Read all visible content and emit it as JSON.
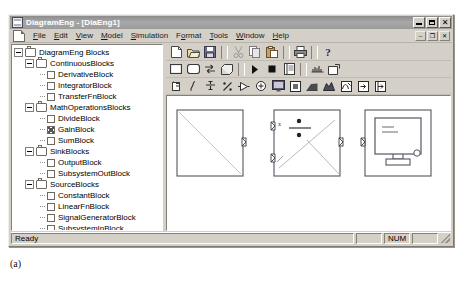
{
  "window": {
    "title": "DiagramEng - [DiaEng1]",
    "title_icon": "app-document-icon",
    "buttons": {
      "minimize": "–",
      "maximize": "□",
      "close": "✕"
    }
  },
  "menu": {
    "doc_icon": "mdi-document-icon",
    "items": [
      {
        "label": "File",
        "mnemonic": "F"
      },
      {
        "label": "Edit",
        "mnemonic": "E"
      },
      {
        "label": "View",
        "mnemonic": "V"
      },
      {
        "label": "Model",
        "mnemonic": "M"
      },
      {
        "label": "Simulation",
        "mnemonic": "S"
      },
      {
        "label": "Format",
        "mnemonic": "o"
      },
      {
        "label": "Tools",
        "mnemonic": "T"
      },
      {
        "label": "Window",
        "mnemonic": "W"
      },
      {
        "label": "Help",
        "mnemonic": "H"
      }
    ],
    "mdi_buttons": {
      "minimize": "–",
      "restore": "❐",
      "close": "✕"
    }
  },
  "tree": {
    "nodes": [
      {
        "label": "DiagramEng Blocks",
        "level": 0,
        "type": "folder",
        "state": "expanded"
      },
      {
        "label": "ContinuousBlocks",
        "level": 1,
        "type": "folder",
        "state": "expanded"
      },
      {
        "label": "DerivativeBlock",
        "level": 2,
        "type": "leaf",
        "state": "none"
      },
      {
        "label": "IntegratorBlock",
        "level": 2,
        "type": "leaf",
        "state": "none"
      },
      {
        "label": "TransferFnBlock",
        "level": 2,
        "type": "leaf",
        "state": "none"
      },
      {
        "label": "MathOperationsBlocks",
        "level": 1,
        "type": "folder",
        "state": "expanded"
      },
      {
        "label": "DivideBlock",
        "level": 2,
        "type": "leaf",
        "state": "none"
      },
      {
        "label": "GainBlock",
        "level": 2,
        "type": "leaf",
        "state": "marked"
      },
      {
        "label": "SumBlock",
        "level": 2,
        "type": "leaf",
        "state": "none"
      },
      {
        "label": "SinkBlocks",
        "level": 1,
        "type": "folder",
        "state": "expanded"
      },
      {
        "label": "OutputBlock",
        "level": 2,
        "type": "leaf",
        "state": "none"
      },
      {
        "label": "SubsystemOutBlock",
        "level": 2,
        "type": "leaf",
        "state": "none"
      },
      {
        "label": "SourceBlocks",
        "level": 1,
        "type": "folder",
        "state": "expanded"
      },
      {
        "label": "ConstantBlock",
        "level": 2,
        "type": "leaf",
        "state": "none"
      },
      {
        "label": "LinearFnBlock",
        "level": 2,
        "type": "leaf",
        "state": "none"
      },
      {
        "label": "SignalGeneratorBlock",
        "level": 2,
        "type": "leaf",
        "state": "none"
      },
      {
        "label": "SubsystemInBlock",
        "level": 2,
        "type": "leaf",
        "state": "none"
      },
      {
        "label": "SubsystemBlocks",
        "level": 1,
        "type": "folder",
        "state": "collapsed"
      }
    ]
  },
  "toolbars": {
    "standard": [
      {
        "name": "new-icon",
        "tip": "New"
      },
      {
        "name": "open-icon",
        "tip": "Open"
      },
      {
        "name": "save-icon",
        "tip": "Save"
      },
      {
        "name": "separator",
        "tip": ""
      },
      {
        "name": "cut-icon",
        "tip": "Cut"
      },
      {
        "name": "copy-icon",
        "tip": "Copy"
      },
      {
        "name": "paste-icon",
        "tip": "Paste"
      },
      {
        "name": "separator",
        "tip": ""
      },
      {
        "name": "print-icon",
        "tip": "Print"
      },
      {
        "name": "separator",
        "tip": ""
      },
      {
        "name": "about-icon",
        "tip": "About"
      }
    ],
    "model": [
      {
        "name": "block-icon",
        "tip": "Block"
      },
      {
        "name": "rounded-block-icon",
        "tip": "Rounded Block"
      },
      {
        "name": "connection-icon",
        "tip": "Connection"
      },
      {
        "name": "subsystem-icon",
        "tip": "Subsystem"
      },
      {
        "name": "separator",
        "tip": ""
      },
      {
        "name": "run-icon",
        "tip": "Run Simulation"
      },
      {
        "name": "stop-icon",
        "tip": "Stop Simulation"
      },
      {
        "name": "sim-params-icon",
        "tip": "Simulation Parameters"
      },
      {
        "name": "separator",
        "tip": ""
      },
      {
        "name": "signal-icon",
        "tip": "Signal"
      },
      {
        "name": "zoom-box-icon",
        "tip": "Zoom"
      }
    ],
    "blocks": [
      {
        "name": "derivative-block-icon",
        "tip": "DerivativeBlock"
      },
      {
        "name": "integrator-block-icon",
        "tip": "IntegratorBlock"
      },
      {
        "name": "transferfn-block-icon",
        "tip": "TransferFnBlock"
      },
      {
        "name": "divide-block-icon",
        "tip": "DivideBlock"
      },
      {
        "name": "gain-block-icon",
        "tip": "GainBlock"
      },
      {
        "name": "sum-block-icon",
        "tip": "SumBlock"
      },
      {
        "name": "output-block-icon",
        "tip": "OutputBlock"
      },
      {
        "name": "subsystem-out-block-icon",
        "tip": "SubsystemOutBlock"
      },
      {
        "name": "constant-block-icon",
        "tip": "ConstantBlock"
      },
      {
        "name": "linearfn-block-icon",
        "tip": "LinearFnBlock"
      },
      {
        "name": "signalgen-block-icon",
        "tip": "SignalGeneratorBlock"
      },
      {
        "name": "subsystem-in-block-icon",
        "tip": "SubsystemInBlock"
      },
      {
        "name": "subsystem-block-icon",
        "tip": "SubsystemBlocks"
      }
    ]
  },
  "canvas": {
    "blocks": [
      {
        "name": "plain-block",
        "x": 10,
        "y": 14,
        "w": 66,
        "h": 66,
        "glyph": "blank"
      },
      {
        "name": "divide-block",
        "x": 107,
        "y": 14,
        "w": 66,
        "h": 66,
        "glyph": "divide"
      },
      {
        "name": "output-block",
        "x": 198,
        "y": 14,
        "w": 66,
        "h": 66,
        "glyph": "scope"
      }
    ]
  },
  "status": {
    "message": "Ready",
    "panes": [
      "",
      "NUM",
      ""
    ]
  },
  "figure": {
    "caption": "(a)"
  }
}
